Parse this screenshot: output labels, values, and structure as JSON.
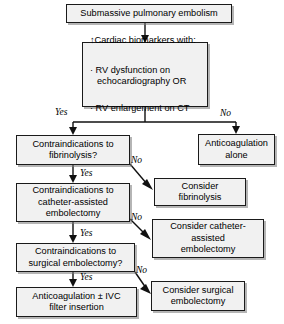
{
  "diagram": {
    "colors": {
      "box_fill": "#f1f1f1",
      "box_border": "#1a1a1a",
      "line": "#111111",
      "text": "#000000",
      "background": "#ffffff"
    },
    "nodes": {
      "start": {
        "label": "Submassive pulmonary embolism"
      },
      "criteria": {
        "title": "↑Cardiac biomarkers with:",
        "items": [
          "· RV dysfunction on\n   echocardiography OR",
          "· RV enlargement on CT"
        ]
      },
      "anticoagulation_alone": {
        "label": "Anticoagulation\nalone"
      },
      "contraindications_fibrinolysis": {
        "label": "Contraindications to\nfibrinolysis?"
      },
      "consider_fibrinolysis": {
        "label": "Consider\nfibrinolysis"
      },
      "contraindications_catheter": {
        "label": "Contraindications to\ncatheter-assisted\nembolectomy"
      },
      "consider_catheter": {
        "label": "Consider catheter-\nassisted\nembolectomy"
      },
      "contraindications_surgical": {
        "label": "Contraindications to\nsurgical embolectomy?"
      },
      "consider_surgical": {
        "label": "Consider surgical\nembolectomy"
      },
      "anticoagulation_ivc": {
        "label": "Anticoagulation ± IVC\nfilter insertion"
      }
    },
    "edge_labels": {
      "yes_criteria": "Yes",
      "no_criteria": "No",
      "no_fibrinolysis": "No",
      "yes_fibrinolysis": "Yes",
      "no_catheter": "No",
      "yes_catheter": "Yes",
      "no_surgical": "No",
      "yes_surgical": "Yes"
    }
  }
}
